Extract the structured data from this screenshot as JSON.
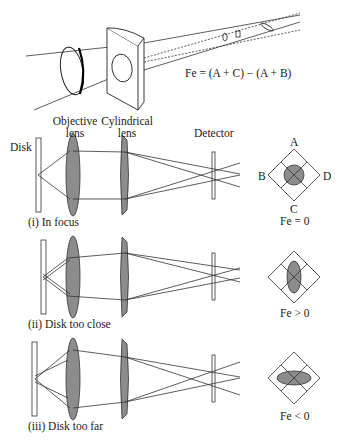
{
  "top_view": {
    "formula": "Fe = (A + C) − (A + B)"
  },
  "labels": {
    "objective_lens_line1": "Objective",
    "objective_lens_line2": "lens",
    "cylindrical_lens_line1": "Cylindrical",
    "cylindrical_lens_line2": "lens",
    "detector": "Detector",
    "disk": "Disk"
  },
  "quadrant_labels": {
    "a": "A",
    "b": "B",
    "c": "C",
    "d": "D"
  },
  "panels": [
    {
      "caption": "(i) In focus",
      "result": "Fe = 0",
      "spot": "circle"
    },
    {
      "caption": "(ii) Disk too close",
      "result": "Fe > 0",
      "spot": "vertical-ellipse"
    },
    {
      "caption": "(iii) Disk too far",
      "result": "Fe < 0",
      "spot": "horizontal-ellipse"
    }
  ],
  "colors": {
    "lens_fill": "#8c8c8c",
    "line": "#333333",
    "background": "#ffffff"
  }
}
